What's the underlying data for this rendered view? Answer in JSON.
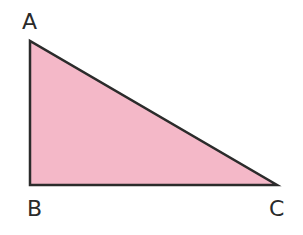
{
  "diagram": {
    "shape": "right-triangle",
    "fill_color": "#f4b8c8",
    "stroke_color": "#2b2b2b",
    "vertices": [
      {
        "label": "A",
        "x": 30,
        "y": 41
      },
      {
        "label": "B",
        "x": 30,
        "y": 185
      },
      {
        "label": "C",
        "x": 277,
        "y": 185
      }
    ],
    "labels": {
      "a": "A",
      "b": "B",
      "c": "C"
    }
  }
}
